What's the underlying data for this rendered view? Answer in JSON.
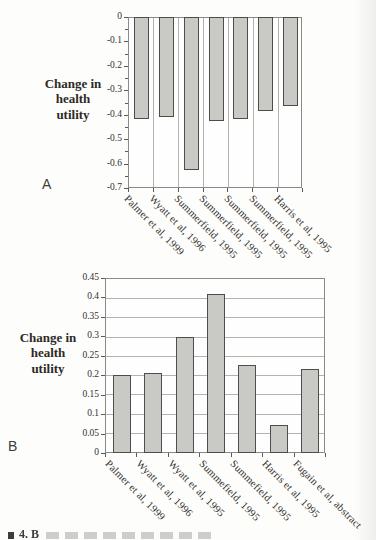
{
  "figure": {
    "caption_fragment": "4. B"
  },
  "colors": {
    "bar_fill": "#c9c9c5",
    "bar_border": "#4d4d4a",
    "plot_border": "#8a8a86",
    "gridline": "#b2b2ae",
    "text": "#2e2a26"
  },
  "chart_data": [
    {
      "panel": "A",
      "type": "bar",
      "orientation": "down",
      "title": "",
      "ylabel": "Change in health utility",
      "xlabel": "",
      "ylim": [
        -0.7,
        0
      ],
      "yticks": [
        0,
        -0.1,
        -0.2,
        -0.3,
        -0.4,
        -0.5,
        -0.6,
        -0.7
      ],
      "ytick_labels": [
        "0",
        "-0.1",
        "-0.2",
        "-0.3",
        "-0.4",
        "-0.5",
        "-0.6",
        "-0.7"
      ],
      "minor_tick_step": 0.05,
      "grid": "vertical",
      "legend": "none",
      "categories": [
        "Palmer et al, 1999",
        "Wyatt et al, 1996",
        "Summerfield, 1995",
        "Summerfield, 1995",
        "Summerfield, 1995",
        "Summerfield, 1995",
        "Harris et al, 1995"
      ],
      "values": [
        -0.42,
        -0.41,
        -0.63,
        -0.425,
        -0.42,
        -0.385,
        -0.365
      ]
    },
    {
      "panel": "B",
      "type": "bar",
      "orientation": "up",
      "title": "",
      "ylabel": "Change in health utility",
      "xlabel": "",
      "ylim": [
        0,
        0.45
      ],
      "yticks": [
        0.45,
        0.4,
        0.35,
        0.3,
        0.25,
        0.2,
        0.15,
        0.1,
        0.05,
        0
      ],
      "ytick_labels": [
        "0.45",
        "0.4",
        "0.35",
        "0.3",
        "0.25",
        "0.2",
        "0.15",
        "0.1",
        "0.05",
        "0"
      ],
      "minor_tick_step": null,
      "grid": "horizontal",
      "legend": "none",
      "categories": [
        "Palmer et al, 1999",
        "Wyatt et al, 1996",
        "Wyatt et al, 1995",
        "Summefield, 1995",
        "Summefield, 1995",
        "Harris et al, 1995",
        "Fugain et al, abstract"
      ],
      "values": [
        0.2,
        0.205,
        0.3,
        0.41,
        0.225,
        0.07,
        0.215
      ]
    }
  ]
}
